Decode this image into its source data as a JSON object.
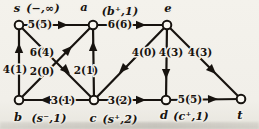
{
  "figure": {
    "colors": {
      "background": "#f2f0ea",
      "ink": "#17130f",
      "node_fill": "#faf8f2"
    },
    "canvas": {
      "width": 259,
      "height": 129
    }
  },
  "graph": {
    "nodes": [
      {
        "id": "s",
        "x": 19,
        "y": 25,
        "letter": "s",
        "letter_x": 17,
        "letter_y": 12,
        "tag": "(−,∞)",
        "tag_x": 43,
        "tag_y": 12
      },
      {
        "id": "a",
        "x": 93,
        "y": 25,
        "letter": "a",
        "letter_x": 84,
        "letter_y": 11,
        "tag": "(b⁺,1)",
        "tag_x": 120,
        "tag_y": 15
      },
      {
        "id": "e",
        "x": 167,
        "y": 25,
        "letter": "e",
        "letter_x": 168,
        "letter_y": 12,
        "tag": "",
        "tag_x": 0,
        "tag_y": 0
      },
      {
        "id": "b",
        "x": 19,
        "y": 100,
        "letter": "b",
        "letter_x": 18,
        "letter_y": 121,
        "tag": "(s⁻,1)",
        "tag_x": 49,
        "tag_y": 122
      },
      {
        "id": "c",
        "x": 94,
        "y": 100,
        "letter": "c",
        "letter_x": 93,
        "letter_y": 122,
        "tag": "(s⁺,2)",
        "tag_x": 120,
        "tag_y": 123
      },
      {
        "id": "d",
        "x": 166,
        "y": 100,
        "letter": "d",
        "letter_x": 164,
        "letter_y": 119,
        "tag": "(c⁺,1)",
        "tag_x": 191,
        "tag_y": 120
      },
      {
        "id": "t",
        "x": 241,
        "y": 99,
        "letter": "t",
        "letter_x": 240,
        "letter_y": 119,
        "tag": "",
        "tag_x": 0,
        "tag_y": 0
      }
    ],
    "edges": [
      {
        "from": "b",
        "to": "s",
        "label": "4(1)",
        "label_x": 15,
        "label_y": 73,
        "tip_x": 19,
        "tip_y": 43
      },
      {
        "from": "s",
        "to": "a",
        "label": "5(5)",
        "label_x": 40,
        "label_y": 28,
        "tip_x": 68,
        "tip_y": 25
      },
      {
        "from": "a",
        "to": "e",
        "label": "6(6)",
        "label_x": 120,
        "label_y": 28,
        "tip_x": 146,
        "tip_y": 25
      },
      {
        "from": "s",
        "to": "c",
        "label": "6(4)",
        "label_x": 42,
        "label_y": 56,
        "tip_x": 70,
        "tip_y": 74
      },
      {
        "from": "b",
        "to": "a",
        "label": "2(0)",
        "label_x": 42,
        "label_y": 75,
        "tip_x": 72,
        "tip_y": 46
      },
      {
        "from": "c",
        "to": "a",
        "label": "2(1)",
        "label_x": 86,
        "label_y": 74,
        "tip_x": 93,
        "tip_y": 41
      },
      {
        "from": "e",
        "to": "c",
        "label": "4(0)",
        "label_x": 144,
        "label_y": 56,
        "tip_x": 119,
        "tip_y": 73
      },
      {
        "from": "e",
        "to": "d",
        "label": "4(3)",
        "label_x": 171,
        "label_y": 56,
        "tip_x": 166,
        "tip_y": 79
      },
      {
        "from": "e",
        "to": "t",
        "label": "4(3)",
        "label_x": 200,
        "label_y": 56,
        "tip_x": 216,
        "tip_y": 74
      },
      {
        "from": "c",
        "to": "b",
        "label": "3(1)",
        "label_x": 63,
        "label_y": 104,
        "tip_x": 40,
        "tip_y": 100
      },
      {
        "from": "c",
        "to": "d",
        "label": "3(2)",
        "label_x": 120,
        "label_y": 104,
        "tip_x": 146,
        "tip_y": 100
      },
      {
        "from": "d",
        "to": "t",
        "label": "5(5)",
        "label_x": 190,
        "label_y": 103,
        "tip_x": 218,
        "tip_y": 99
      }
    ],
    "style": {
      "line_width": 2.2,
      "node_radius": 4.3,
      "node_stroke": 2,
      "arrow_length": 10,
      "arrow_half_width": 4.2
    }
  }
}
